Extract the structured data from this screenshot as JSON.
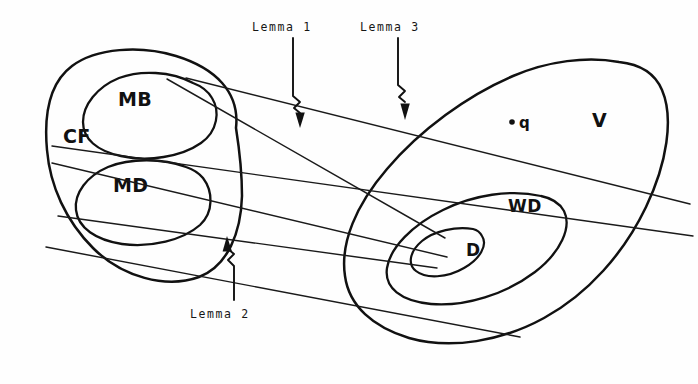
{
  "figure": {
    "kind": "hand-drawn-set-diagram",
    "background_color": "#fefefe",
    "ink_color": "#111111",
    "width": 698,
    "height": 384
  },
  "regions": {
    "cf": {
      "label": "CF",
      "description": "large left blob",
      "label_x": 63,
      "label_y": 143
    },
    "mb": {
      "label": "MB",
      "description": "upper inner blob inside CF",
      "label_x": 118,
      "label_y": 106
    },
    "md": {
      "label": "MD",
      "description": "lower inner blob inside CF",
      "label_x": 113,
      "label_y": 192
    },
    "v": {
      "label": "V",
      "description": "large tilted right blob",
      "label_x": 592,
      "label_y": 127
    },
    "wd": {
      "label": "WD",
      "description": "inner blob inside V",
      "label_x": 508,
      "label_y": 212
    },
    "d": {
      "label": "D",
      "description": "innermost blob inside WD",
      "label_x": 466,
      "label_y": 256
    }
  },
  "point": {
    "name": "marked-point-q",
    "label": "q",
    "dot_x": 512,
    "dot_y": 122,
    "label_x": 520,
    "label_y": 127
  },
  "annotations": [
    {
      "id": "lemma-1",
      "label": "Lemma 1",
      "caption_x": 252,
      "caption_y": 20,
      "direction": "down",
      "target": "upper line bundle"
    },
    {
      "id": "lemma-2",
      "label": "Lemma 2",
      "caption_x": 190,
      "caption_y": 307,
      "direction": "up",
      "target": "lower line bundle"
    },
    {
      "id": "lemma-3",
      "label": "Lemma 3",
      "caption_x": 360,
      "caption_y": 20,
      "direction": "down",
      "target": "upper line bundle"
    }
  ],
  "connectors": {
    "count": 4,
    "description": "four long straight lines running from the CF blob on the left to the D blob on the right"
  }
}
